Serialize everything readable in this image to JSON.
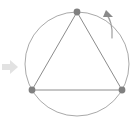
{
  "figure": {
    "title": "Equilateral triangle inscribed in a circle with rotation indicator",
    "canvas": {
      "width": 139,
      "height": 129,
      "background": "#ffffff"
    },
    "colors": {
      "circle_stroke": "#a9a9a9",
      "triangle_stroke": "#8c8c8c",
      "vertex_fill": "#808080",
      "rotation_arc_stroke": "#9e9e9e",
      "rotation_arrow_fill": "#8a8a8a",
      "pointer_arrow_fill": "#e2e2e2",
      "pointer_arrow_stroke": "#dcdcdc"
    },
    "circle": {
      "label": "circumscribed-circle",
      "center_x": 77,
      "center_y": 64,
      "radius": 52,
      "stroke_width": 1
    },
    "triangle": {
      "label": "inscribed-equilateral-triangle",
      "stroke_width": 1,
      "vertices": [
        {
          "name": "top-vertex",
          "x": 77,
          "y": 12,
          "radius": 3.4
        },
        {
          "name": "bottom-left-vertex",
          "x": 32,
          "y": 90,
          "radius": 3.4
        },
        {
          "name": "bottom-right-vertex",
          "x": 122,
          "y": 90,
          "radius": 3.4
        }
      ]
    },
    "rotation_indicator": {
      "label": "counterclockwise-rotation-arc",
      "direction": "counterclockwise",
      "arc_path": "M 112 38 C 113 27 110 18 106 14",
      "arrow_head_points": "106,10 113,17 103,17",
      "stroke_width": 1.2
    },
    "pointer_arrow": {
      "label": "left-transform-pointer",
      "description": "light gray right-pointing arrow at the left margin",
      "body": {
        "x": 2,
        "y": 64,
        "width": 9,
        "height": 6
      },
      "head_points": "10,60 18,67 10,74"
    }
  }
}
